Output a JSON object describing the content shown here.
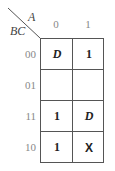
{
  "kmap": {
    "row_var_label": "BC",
    "col_var_label": "A",
    "columns": [
      "0",
      "1"
    ],
    "rows": [
      "00",
      "01",
      "11",
      "10"
    ],
    "cells": [
      [
        "D",
        "1"
      ],
      [
        "",
        ""
      ],
      [
        "1",
        "D"
      ],
      [
        "1",
        "X"
      ]
    ]
  }
}
